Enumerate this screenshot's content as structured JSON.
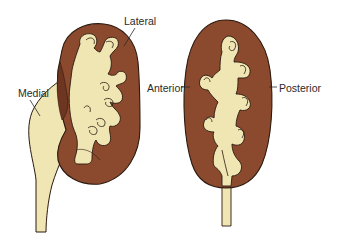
{
  "figure": {
    "colors": {
      "cortex": "#8B4A2E",
      "cortex_dark": "#6E3620",
      "pelvis": "#F0E6B4",
      "outline": "#2B1A10",
      "background": "#FFFFFF"
    },
    "left_kidney": {
      "view": "frontal section",
      "labels": {
        "lateral": "Lateral",
        "medial": "Medial"
      }
    },
    "right_kidney": {
      "view": "side section",
      "labels": {
        "anterior": "Anterior",
        "posterior": "Posterior"
      }
    }
  }
}
